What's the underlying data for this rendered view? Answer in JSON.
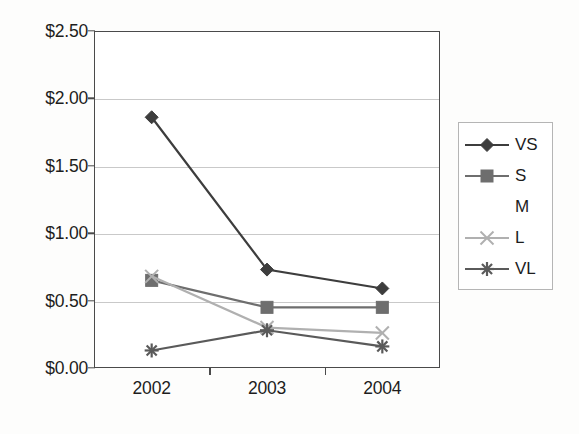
{
  "chart_data": {
    "type": "line",
    "title": "",
    "subtitle": "",
    "xlabel": "",
    "ylabel": "",
    "categories": [
      "2002",
      "2003",
      "2004"
    ],
    "ylim": [
      0,
      2.5
    ],
    "ytick_values": [
      0,
      0.5,
      1.0,
      1.5,
      2.0,
      2.5
    ],
    "ytick_labels": [
      "$0.00",
      "$0.50",
      "$1.00",
      "$1.50",
      "$2.00",
      "$2.50"
    ],
    "xtick_labels": [
      "2002",
      "2003",
      "2004"
    ],
    "grid": "horizontal",
    "legend_position": "right",
    "series": [
      {
        "name": "VS",
        "marker": "diamond",
        "color": "#3d3d3d",
        "values": [
          1.86,
          0.73,
          0.59
        ]
      },
      {
        "name": "S",
        "marker": "square",
        "color": "#6e6e6e",
        "values": [
          0.65,
          0.45,
          0.45
        ]
      },
      {
        "name": "M",
        "marker": "none",
        "color": "#ffffff",
        "values": [
          null,
          null,
          null
        ]
      },
      {
        "name": "L",
        "marker": "x",
        "color": "#b0b0b0",
        "values": [
          0.68,
          0.3,
          0.26
        ]
      },
      {
        "name": "VL",
        "marker": "asterisk",
        "color": "#5a5a5a",
        "values": [
          0.13,
          0.28,
          0.16
        ]
      }
    ]
  },
  "legend": {
    "entries": [
      {
        "label": "VS"
      },
      {
        "label": "S"
      },
      {
        "label": "M"
      },
      {
        "label": "L"
      },
      {
        "label": "VL"
      }
    ]
  },
  "colors": {
    "axis": "#4a4a4a",
    "gridline": "#c9c9c9",
    "text": "#1d1d1d",
    "plot_background": "#ffffff",
    "page_background": "#fdfdfc",
    "legend_border": "#b5b5b5"
  }
}
